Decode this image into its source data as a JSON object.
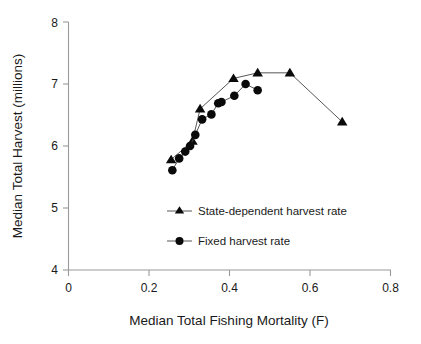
{
  "chart_data": {
    "type": "line",
    "title": "",
    "subtitle": "",
    "xlabel": "Median Total Fishing Mortality (F)",
    "ylabel": "Median Total Harvest (millions)",
    "xlim": [
      0,
      0.8
    ],
    "ylim": [
      4,
      8
    ],
    "xticks": [
      0,
      0.2,
      0.4,
      0.6,
      0.8
    ],
    "xtick_labels": [
      "0",
      "0.2",
      "0.4",
      "0.6",
      "0.8"
    ],
    "yticks": [
      4,
      5,
      6,
      7,
      8
    ],
    "ytick_labels": [
      "4",
      "5",
      "6",
      "7",
      "8"
    ],
    "grid": false,
    "legend_position": "inside-center-left",
    "series": [
      {
        "name": "State-dependent harvest rate",
        "marker": "triangle",
        "color": "#0a0a0a",
        "points": [
          [
            0.255,
            5.78
          ],
          [
            0.308,
            6.08
          ],
          [
            0.327,
            6.6
          ],
          [
            0.41,
            7.09
          ],
          [
            0.47,
            7.18
          ],
          [
            0.55,
            7.18
          ],
          [
            0.68,
            6.39
          ]
        ]
      },
      {
        "name": "Fixed harvest rate",
        "marker": "circle",
        "color": "#0a0a0a",
        "points": [
          [
            0.258,
            5.61
          ],
          [
            0.275,
            5.8
          ],
          [
            0.29,
            5.91
          ],
          [
            0.302,
            6.0
          ],
          [
            0.315,
            6.18
          ],
          [
            0.332,
            6.43
          ],
          [
            0.355,
            6.51
          ],
          [
            0.372,
            6.69
          ],
          [
            0.38,
            6.71
          ],
          [
            0.412,
            6.81
          ],
          [
            0.44,
            7.0
          ],
          [
            0.47,
            6.9
          ]
        ]
      }
    ]
  },
  "legend": {
    "entries": [
      {
        "label": "State-dependent harvest rate",
        "marker": "triangle-marker-icon"
      },
      {
        "label": "Fixed harvest rate",
        "marker": "circle-marker-icon"
      }
    ]
  },
  "colors": {
    "marker": "#0a0a0a",
    "line": "#444444",
    "axis": "#9a9a9a",
    "text": "#1a1a1a",
    "background": "#ffffff"
  }
}
